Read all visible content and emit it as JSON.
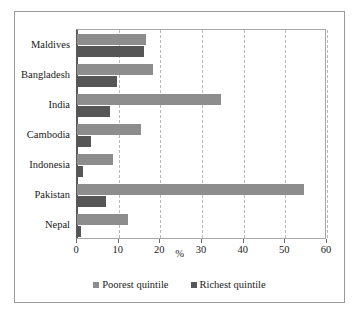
{
  "chart_data": {
    "type": "bar",
    "orientation": "horizontal",
    "title": "",
    "xlabel": "%",
    "ylabel": "",
    "xlim": [
      0,
      60
    ],
    "xticks": [
      0,
      10,
      20,
      30,
      40,
      50,
      60
    ],
    "grid": "vertical-dashed",
    "legend_position": "bottom",
    "categories": [
      "Maldives",
      "Bangladesh",
      "India",
      "Cambodia",
      "Indonesia",
      "Pakistan",
      "Nepal"
    ],
    "series": [
      {
        "name": "Poorest quintile",
        "color": "#8d8d8d",
        "values": [
          16.5,
          18.2,
          34.5,
          15.3,
          8.7,
          54.5,
          12.3
        ]
      },
      {
        "name": "Richest quintile",
        "color": "#565656",
        "values": [
          16.0,
          9.6,
          8.0,
          3.3,
          1.5,
          7.0,
          1.0
        ]
      }
    ]
  }
}
